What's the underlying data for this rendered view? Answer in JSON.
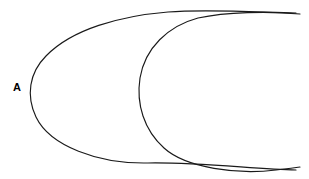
{
  "diagram": {
    "background_color": "#ffffff",
    "stroke_color": "#1a1a1a",
    "stroke_width": 1.15,
    "width": 309,
    "height": 179,
    "labels": [
      {
        "id": "A",
        "text": "A",
        "x": 18,
        "y": 88,
        "bold": true,
        "font_size": 11,
        "color": "#000000"
      }
    ],
    "shapes": [
      {
        "name": "set-a-outline",
        "kind": "open-oval",
        "description": "Left oval, open at right edge, drawn as a hand-drawn rounded blob",
        "leftmost_point": [
          28,
          88
        ],
        "top_point": [
          130,
          10
        ],
        "bottom_point": [
          150,
          163
        ],
        "right_end_top": [
          296,
          13
        ],
        "right_end_bottom": [
          296,
          170
        ],
        "path": "M 296 13 C 255 12 205 9 168 12 C 120 16 72 29 46 56 C 29 73 26 96 36 117 C 50 146 98 164 148 163 C 196 162 255 169 296 170"
      },
      {
        "name": "set-b-outline",
        "kind": "open-oval",
        "description": "Right oval, shifted right, open at right edge, overlapping set A",
        "leftmost_point": [
          139,
          100
        ],
        "top_point": [
          248,
          11
        ],
        "bottom_point": [
          252,
          170
        ],
        "right_end_top": [
          300,
          14
        ],
        "right_end_bottom": [
          300,
          167
        ],
        "path": "M 300 14 C 268 11 226 12 198 18 C 168 26 145 48 140 78 C 136 104 144 130 164 148 C 186 168 238 175 276 170 C 285 169 294 168 300 167"
      }
    ],
    "intersections": [
      {
        "name": "upper-crossing",
        "x": 182,
        "y": 17
      },
      {
        "name": "lower-crossing",
        "x": 180,
        "y": 160
      }
    ]
  }
}
